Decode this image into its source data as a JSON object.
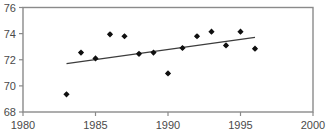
{
  "chart_data": {
    "type": "scatter",
    "title": "",
    "subtitle": "",
    "xlabel": "",
    "ylabel": "",
    "xlim": [
      1980,
      2000
    ],
    "ylim": [
      68,
      76
    ],
    "grid": false,
    "legend": null,
    "x_ticks": [
      1980,
      1985,
      1990,
      1995,
      2000
    ],
    "x_tick_labels": [
      "1980",
      "1985",
      "1990",
      "1995",
      "2000"
    ],
    "y_ticks": [
      68,
      70,
      72,
      74,
      76
    ],
    "y_tick_labels": [
      "68",
      "70",
      "72",
      "74",
      "76"
    ],
    "series": [
      {
        "name": "observations",
        "marker": "diamond",
        "color": "#101010",
        "x": [
          1983,
          1984,
          1985,
          1986,
          1987,
          1988,
          1989,
          1990,
          1991,
          1992,
          1993,
          1994,
          1995,
          1996
        ],
        "values": [
          69.35,
          72.55,
          72.1,
          73.95,
          73.8,
          72.45,
          72.55,
          70.95,
          72.9,
          73.8,
          74.15,
          73.1,
          74.15,
          72.85
        ]
      },
      {
        "name": "trend-line",
        "marker": "none",
        "color": "#3c3c3c",
        "x": [
          1983,
          1996
        ],
        "values": [
          71.7,
          73.72
        ]
      }
    ]
  }
}
